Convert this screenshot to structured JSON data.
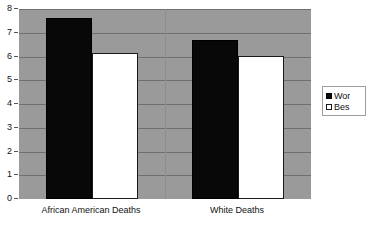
{
  "chart_data": {
    "type": "bar",
    "title": "",
    "subtitle": "",
    "xlabel": "",
    "ylabel": "",
    "categories": [
      "African American Deaths",
      "White Deaths"
    ],
    "series": [
      {
        "name": "Wor",
        "values": [
          7.6,
          6.7
        ],
        "color": "#080808"
      },
      {
        "name": "Bes",
        "values": [
          6.15,
          6.0
        ],
        "color": "#ffffff"
      }
    ],
    "ylim": [
      0,
      8
    ],
    "yticks": [
      0,
      1,
      2,
      3,
      4,
      5,
      6,
      7,
      8
    ],
    "ytick_labels": [
      "0",
      "1",
      "2",
      "3",
      "4",
      "5",
      "6",
      "7",
      "8"
    ],
    "grid": true,
    "grid_axis": "y",
    "legend_position": "right",
    "legend_clipped": true,
    "plot_background": "#9a9a9a",
    "figure_background": "#ffffff",
    "gridline_color": "#6f6f6f"
  },
  "legend": {
    "entries": [
      {
        "label": "Wor",
        "swatch": "black-square"
      },
      {
        "label": "Bes",
        "swatch": "white-square"
      }
    ]
  },
  "y_axis": {
    "ticks": [
      "8",
      "7",
      "6",
      "5",
      "4",
      "3",
      "2",
      "1",
      "0"
    ]
  },
  "x_axis": {
    "ticks": [
      "African American Deaths",
      "White Deaths"
    ]
  }
}
